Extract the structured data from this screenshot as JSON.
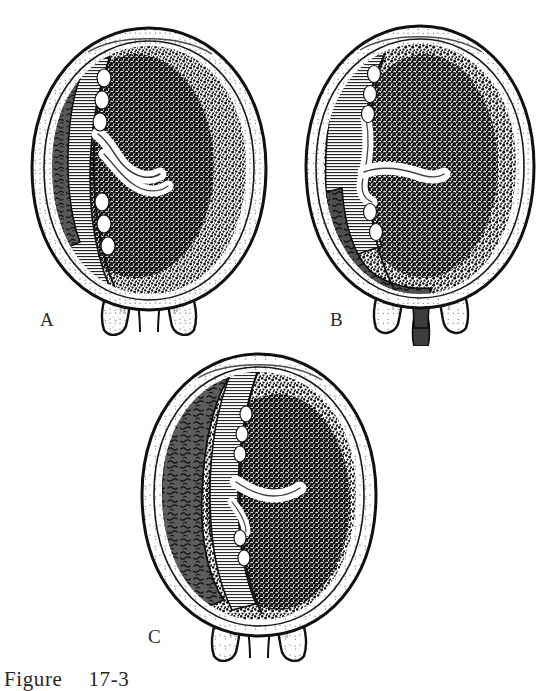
{
  "figure": {
    "caption_prefix": "Figure",
    "caption_number": "17-3",
    "background_color": "#ffffff",
    "ink_color": "#1a1a1a",
    "clot_color": "#595959",
    "placenta_hatch_color": "#2b2b2b",
    "fetal_mass_color": "#141414"
  },
  "panels": [
    {
      "id": "a",
      "label": "A",
      "title": "Concealed hemorrhage",
      "description": "Partial separation of the placenta with a small retroplacental clot confined within the uterus; cervix closed, no external bleeding.",
      "clot_extent": "small",
      "cervix_state": "closed",
      "external_bleeding": "none"
    },
    {
      "id": "b",
      "label": "B",
      "title": "Apparent or revealed hemorrhage",
      "description": "Marginal separation with blood tracking between the membranes and uterine wall, escaping through the cervix as visible vaginal bleeding.",
      "clot_extent": "marginal-tracking",
      "cervix_state": "open",
      "external_bleeding": "visible"
    },
    {
      "id": "c",
      "label": "C",
      "title": "Complete concealed hemorrhage",
      "description": "Extensive separation with a large retroplacental clot filling the upper segment; bleeding remains entirely concealed within the uterus.",
      "clot_extent": "large",
      "cervix_state": "closed",
      "external_bleeding": "none"
    }
  ]
}
